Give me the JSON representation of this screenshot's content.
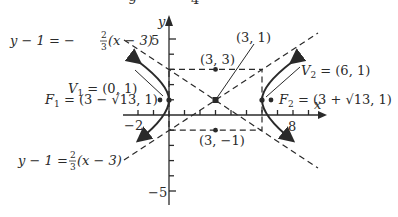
{
  "figure": {
    "type": "hyperbola-graph",
    "equation_hint": "(x-3)^2/9 - (y-1)^2/4 = 1",
    "top_cutoff_digits": [
      "9",
      "4"
    ],
    "axes": {
      "x_label": "x",
      "y_label": "y",
      "x_ticks": {
        "neg": "−2",
        "pos": "8"
      },
      "y_ticks": {
        "pos": "5",
        "neg": "−5"
      }
    },
    "asymptotes": [
      {
        "label_lhs": "y − 1 = −",
        "num": "2",
        "den": "3",
        "label_rhs": "(x − 3)"
      },
      {
        "label_lhs": "y − 1 = ",
        "num": "2",
        "den": "3",
        "label_rhs": "(x − 3)"
      }
    ],
    "points": {
      "center": "(3, 1)",
      "top": "(3, 3)",
      "bottom": "(3, −1)",
      "v1_name": "V",
      "v1_sub": "1",
      "v1_val": " = (0, 1)",
      "v2_name": "V",
      "v2_sub": "2",
      "v2_val": " = (6, 1)",
      "f1_name": "F",
      "f1_sub": "1",
      "f1_val": " = (3 −  √13, 1)",
      "f2_name": "F",
      "f2_sub": "2",
      "f2_val": " = (3 +  √13, 1)"
    }
  }
}
